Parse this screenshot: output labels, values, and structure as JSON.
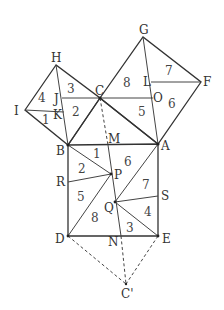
{
  "diagram": {
    "title": "",
    "points": {
      "A": {
        "label": "A",
        "x": 158,
        "y": 144
      },
      "B": {
        "label": "B",
        "x": 68,
        "y": 145
      },
      "C": {
        "label": "C",
        "x": 100,
        "y": 98
      },
      "D": {
        "label": "D",
        "x": 68,
        "y": 236
      },
      "E": {
        "label": "E",
        "x": 158,
        "y": 236
      },
      "F": {
        "label": "F",
        "x": 201,
        "y": 82
      },
      "G": {
        "label": "G",
        "x": 143,
        "y": 37
      },
      "H": {
        "label": "H",
        "x": 56,
        "y": 65
      },
      "I": {
        "label": "I",
        "x": 25,
        "y": 110
      },
      "J": {
        "label": "J",
        "x": 62,
        "y": 98
      },
      "K": {
        "label": "K",
        "x": 64,
        "y": 112
      },
      "L": {
        "label": "L",
        "x": 151,
        "y": 82
      },
      "O": {
        "label": "O",
        "x": 153,
        "y": 98
      },
      "M": {
        "label": "M",
        "x": 108,
        "y": 145
      },
      "N": {
        "label": "N",
        "x": 121,
        "y": 236
      },
      "P": {
        "label": "P",
        "x": 111,
        "y": 174
      },
      "Q": {
        "label": "Q",
        "x": 115,
        "y": 202
      },
      "R": {
        "label": "R",
        "x": 68,
        "y": 182
      },
      "S": {
        "label": "S",
        "x": 158,
        "y": 196
      },
      "Cp": {
        "label": "C'",
        "x": 126,
        "y": 284
      }
    },
    "region_numbers": {
      "small_square": [
        "4",
        "3",
        "1",
        "2"
      ],
      "medium_square": [
        "8",
        "7",
        "5",
        "6"
      ],
      "large_square": [
        "1",
        "2",
        "6",
        "5",
        "7",
        "8",
        "4",
        "3"
      ]
    },
    "colors": {
      "line": "#333333",
      "text": "#333333",
      "background": "#ffffff"
    }
  }
}
